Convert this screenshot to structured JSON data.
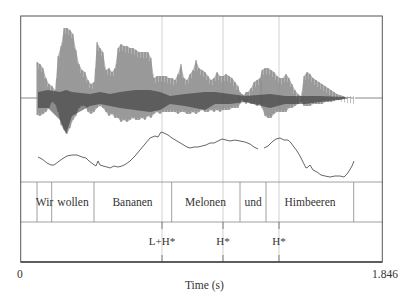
{
  "figure": {
    "frame": {
      "left": 20.7,
      "right": 382.3,
      "top": 16,
      "wave_bottom": 182,
      "word_bottom": 222,
      "bottom": 262
    },
    "colors": {
      "frame": "#555555",
      "wave": "#6a6a6a",
      "wave_dark": "#2b2b2b",
      "pitch": "#555555",
      "guide": "#bdbdbd",
      "tier_line": "#888888"
    },
    "axis": {
      "xlabel": "Time (s)",
      "xmin_label": "0",
      "xmax_label": "1.846",
      "xmin": 0,
      "xmax": 1.846
    },
    "word_tier": {
      "boundaries_px": [
        37,
        51.7,
        94,
        171.7,
        240,
        266,
        353.7
      ],
      "words": [
        {
          "label": "Wir",
          "center_px": 44.5
        },
        {
          "label": "wollen",
          "center_px": 73
        },
        {
          "label": "Bananen",
          "center_px": 132.5
        },
        {
          "label": "Melonen",
          "center_px": 205.5
        },
        {
          "label": "und",
          "center_px": 253
        },
        {
          "label": "Himbeeren",
          "center_px": 310
        }
      ]
    },
    "tone_tier": {
      "tones": [
        {
          "label": "L+H*",
          "x_px": 162
        },
        {
          "label": "H*",
          "x_px": 223
        },
        {
          "label": "H*",
          "x_px": 279
        }
      ]
    },
    "pitch_segments": [
      [
        [
          38,
          157
        ],
        [
          42,
          159
        ],
        [
          47,
          163
        ],
        [
          51,
          165
        ],
        [
          54,
          165
        ],
        [
          58,
          162
        ],
        [
          62,
          159
        ],
        [
          67,
          156
        ],
        [
          72,
          155
        ],
        [
          77,
          155
        ],
        [
          82,
          157
        ],
        [
          86,
          158
        ],
        [
          89,
          161
        ],
        [
          93,
          164
        ],
        [
          96,
          166
        ],
        [
          98,
          161
        ],
        [
          100,
          165
        ],
        [
          103,
          166
        ],
        [
          107,
          167
        ],
        [
          110,
          168
        ],
        [
          114,
          166
        ],
        [
          118,
          167
        ],
        [
          122,
          166
        ],
        [
          126,
          164
        ],
        [
          130,
          161
        ],
        [
          135,
          156
        ],
        [
          140,
          150
        ],
        [
          145,
          144
        ],
        [
          150,
          138
        ],
        [
          155,
          136
        ],
        [
          158,
          137
        ],
        [
          161,
          132
        ],
        [
          164,
          133
        ],
        [
          168,
          135
        ],
        [
          172,
          138
        ],
        [
          177,
          141
        ],
        [
          182,
          144
        ],
        [
          187,
          147
        ],
        [
          190,
          148
        ],
        [
          194,
          147
        ],
        [
          198,
          147
        ],
        [
          202,
          146
        ],
        [
          206,
          145
        ],
        [
          210,
          143
        ],
        [
          214,
          143
        ],
        [
          218,
          141
        ],
        [
          222,
          139
        ],
        [
          226,
          140
        ],
        [
          230,
          141
        ],
        [
          235,
          140
        ],
        [
          240,
          141
        ],
        [
          245,
          142
        ],
        [
          250,
          144
        ],
        [
          254,
          147
        ],
        [
          258,
          149
        ]
      ],
      [
        [
          264,
          148
        ],
        [
          268,
          146
        ],
        [
          272,
          142
        ],
        [
          276,
          139
        ],
        [
          280,
          138
        ],
        [
          284,
          140
        ],
        [
          288,
          140
        ],
        [
          291,
          143
        ],
        [
          294,
          147
        ],
        [
          297,
          151
        ],
        [
          300,
          156
        ],
        [
          303,
          162
        ],
        [
          306,
          168
        ],
        [
          308,
          167
        ],
        [
          310,
          165
        ],
        [
          313,
          170
        ],
        [
          317,
          172
        ],
        [
          321,
          175
        ],
        [
          325,
          176
        ],
        [
          330,
          177
        ],
        [
          335,
          176
        ],
        [
          340,
          176
        ],
        [
          344,
          177
        ],
        [
          347,
          174
        ],
        [
          349,
          171
        ],
        [
          352,
          166
        ],
        [
          354,
          161
        ]
      ]
    ]
  }
}
